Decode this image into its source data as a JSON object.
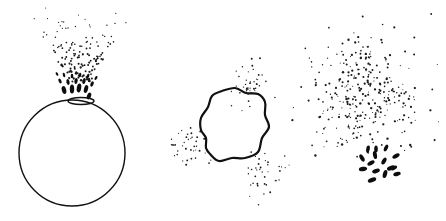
{
  "figure": {
    "width": 446,
    "height": 221,
    "background": "#ffffff",
    "ink_color": "#111111",
    "panels": [
      {
        "id": "panel-1",
        "description": "sphere with particle spray erupting from surface bulge",
        "sphere": {
          "cx": 72,
          "cy": 153,
          "r": 53
        },
        "bulge": {
          "cx": 81,
          "cy": 101,
          "rx": 13,
          "ry": 3.5
        },
        "blobs": [
          {
            "x": 64,
            "y": 90,
            "rx": 2.2,
            "ry": 4,
            "rot": -15
          },
          {
            "x": 72,
            "y": 89,
            "rx": 2.2,
            "ry": 4.5,
            "rot": 0
          },
          {
            "x": 79,
            "y": 88,
            "rx": 2.2,
            "ry": 4.5,
            "rot": 10
          },
          {
            "x": 86,
            "y": 89,
            "rx": 2,
            "ry": 4,
            "rot": 15
          },
          {
            "x": 89,
            "y": 96,
            "rx": 2,
            "ry": 3.5,
            "rot": 20
          },
          {
            "x": 68,
            "y": 82,
            "rx": 1.6,
            "ry": 3,
            "rot": -10
          },
          {
            "x": 76,
            "y": 81,
            "rx": 1.6,
            "ry": 3,
            "rot": 5
          },
          {
            "x": 84,
            "y": 81,
            "rx": 1.6,
            "ry": 3,
            "rot": 15
          },
          {
            "x": 92,
            "y": 84,
            "rx": 1.5,
            "ry": 2.8,
            "rot": 25
          },
          {
            "x": 60,
            "y": 81,
            "rx": 1.4,
            "ry": 2.6,
            "rot": -25
          },
          {
            "x": 72,
            "y": 76,
            "rx": 1.3,
            "ry": 2.3,
            "rot": 0
          },
          {
            "x": 80,
            "y": 75,
            "rx": 1.3,
            "ry": 2.3,
            "rot": 10
          },
          {
            "x": 88,
            "y": 76,
            "rx": 1.3,
            "ry": 2.3,
            "rot": 20
          },
          {
            "x": 64,
            "y": 75,
            "rx": 1.2,
            "ry": 2.2,
            "rot": -15
          },
          {
            "x": 96,
            "y": 78,
            "rx": 1.2,
            "ry": 2.2,
            "rot": 30
          },
          {
            "x": 57,
            "y": 74,
            "rx": 1.1,
            "ry": 2,
            "rot": -30
          }
        ],
        "spray": {
          "cx": 80,
          "cy": 70,
          "spread_x": 32,
          "spread_y": 32,
          "count": 140,
          "seed": 11,
          "min_y": 8,
          "max_y": 82,
          "r_min": 0.5,
          "r_max": 1.3
        }
      },
      {
        "id": "panel-2",
        "description": "wavy ruptured membrane with three particle clusters",
        "loop_center": {
          "cx": 230,
          "cy": 115
        },
        "loop_points": [
          [
            222,
            91
          ],
          [
            235,
            88
          ],
          [
            246,
            93
          ],
          [
            258,
            94
          ],
          [
            265,
            102
          ],
          [
            265,
            115
          ],
          [
            269,
            127
          ],
          [
            262,
            138
          ],
          [
            258,
            152
          ],
          [
            245,
            158
          ],
          [
            232,
            158
          ],
          [
            219,
            161
          ],
          [
            210,
            154
          ],
          [
            206,
            148
          ],
          [
            206,
            138
          ],
          [
            201,
            130
          ],
          [
            201,
            118
          ],
          [
            208,
            107
          ],
          [
            212,
            96
          ]
        ],
        "clusters": [
          {
            "cx": 252,
            "cy": 85,
            "spread_x": 13,
            "spread_y": 16,
            "count": 42,
            "seed": 3
          },
          {
            "cx": 190,
            "cy": 145,
            "spread_x": 14,
            "spread_y": 12,
            "count": 38,
            "seed": 7
          },
          {
            "cx": 264,
            "cy": 172,
            "spread_x": 14,
            "spread_y": 16,
            "count": 38,
            "seed": 19
          }
        ]
      },
      {
        "id": "panel-3",
        "description": "diffuse particle cloud with cluster of dark ovals below",
        "cloud": {
          "cx": 365,
          "cy": 95,
          "spread_x": 56,
          "spread_y": 62,
          "count": 330,
          "seed": 29,
          "r_min": 0.5,
          "r_max": 1.2
        },
        "blobs": [
          {
            "x": 368,
            "y": 149,
            "rx": 1.8,
            "ry": 3.6,
            "rot": 10
          },
          {
            "x": 376,
            "y": 149,
            "rx": 1.8,
            "ry": 3.6,
            "rot": 0
          },
          {
            "x": 386,
            "y": 148,
            "rx": 1.8,
            "ry": 3.6,
            "rot": 25
          },
          {
            "x": 362,
            "y": 158,
            "rx": 2,
            "ry": 4,
            "rot": -30
          },
          {
            "x": 375,
            "y": 155,
            "rx": 2,
            "ry": 4,
            "rot": -10
          },
          {
            "x": 396,
            "y": 156,
            "rx": 2,
            "ry": 4,
            "rot": 60
          },
          {
            "x": 371,
            "y": 163,
            "rx": 2,
            "ry": 4,
            "rot": 60
          },
          {
            "x": 384,
            "y": 161,
            "rx": 2,
            "ry": 3.8,
            "rot": 30
          },
          {
            "x": 391,
            "y": 168,
            "rx": 2.2,
            "ry": 4.2,
            "rot": 70
          },
          {
            "x": 363,
            "y": 169,
            "rx": 2.2,
            "ry": 4.2,
            "rot": 80
          },
          {
            "x": 376,
            "y": 171,
            "rx": 2.1,
            "ry": 4,
            "rot": 70
          },
          {
            "x": 385,
            "y": 174,
            "rx": 2.1,
            "ry": 4.2,
            "rot": 15
          },
          {
            "x": 397,
            "y": 174,
            "rx": 2,
            "ry": 3.8,
            "rot": 75
          },
          {
            "x": 372,
            "y": 180,
            "rx": 2.2,
            "ry": 4.4,
            "rot": 70
          },
          {
            "x": 394,
            "y": 168,
            "rx": 1.8,
            "ry": 3.4,
            "rot": 60
          }
        ]
      }
    ]
  }
}
